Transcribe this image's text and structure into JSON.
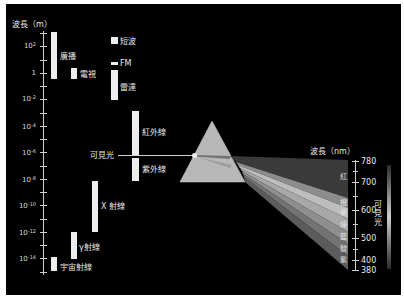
{
  "left_axis": {
    "title": "波長（m）",
    "ticks": [
      {
        "base": "10",
        "exp": "2",
        "y": 46
      },
      {
        "base": "1",
        "exp": "",
        "y": 73
      },
      {
        "base": "10",
        "exp": "-2",
        "y": 99
      },
      {
        "base": "10",
        "exp": "-4",
        "y": 127
      },
      {
        "base": "10",
        "exp": "-6",
        "y": 153
      },
      {
        "base": "10",
        "exp": "-8",
        "y": 180
      },
      {
        "base": "10",
        "exp": "-10",
        "y": 206
      },
      {
        "base": "10",
        "exp": "-12",
        "y": 233
      },
      {
        "base": "10",
        "exp": "-14",
        "y": 259
      }
    ]
  },
  "bands": [
    {
      "label": "廣播",
      "x": 51,
      "y": 32,
      "w": 6,
      "h": 47,
      "lx": 60,
      "ly": 52
    },
    {
      "label": "電視",
      "x": 71,
      "y": 68,
      "w": 6,
      "h": 11,
      "lx": 80,
      "ly": 70
    },
    {
      "label": "短波",
      "x": 111,
      "y": 37,
      "w": 7,
      "h": 7,
      "lx": 120,
      "ly": 37
    },
    {
      "label": "FM",
      "x": 111,
      "y": 62,
      "w": 7,
      "h": 3,
      "lx": 120,
      "ly": 59
    },
    {
      "label": "雷達",
      "x": 111,
      "y": 70,
      "w": 7,
      "h": 30,
      "lx": 120,
      "ly": 83
    },
    {
      "label": "紅外線",
      "x": 132,
      "y": 111,
      "w": 7,
      "h": 44,
      "lx": 142,
      "ly": 128
    },
    {
      "label": "紫外線",
      "x": 132,
      "y": 158,
      "w": 7,
      "h": 23,
      "lx": 142,
      "ly": 165
    },
    {
      "label": "X 射線",
      "x": 92,
      "y": 181,
      "w": 6,
      "h": 51,
      "lx": 101,
      "ly": 202
    },
    {
      "label": "γ射線",
      "x": 71,
      "y": 232,
      "w": 6,
      "h": 27,
      "lx": 79,
      "ly": 243
    },
    {
      "label": "宇宙射線",
      "x": 51,
      "y": 257,
      "w": 6,
      "h": 14,
      "lx": 60,
      "ly": 263
    }
  ],
  "visible_light_label": "可見光",
  "right_axis": {
    "title": "波長（nm）",
    "ticks": [
      {
        "label": "780",
        "y": 161
      },
      {
        "label": "700",
        "y": 182
      },
      {
        "label": "600",
        "y": 210
      },
      {
        "label": "500",
        "y": 238
      },
      {
        "label": "400",
        "y": 260
      },
      {
        "label": "380",
        "y": 270
      }
    ],
    "side_label": "可見光"
  },
  "spectrum_colors": [
    {
      "label": "紅",
      "y": 177,
      "fill": "#3a3a3a"
    },
    {
      "label": "橙",
      "y": 203,
      "fill": "#8c8c8c"
    },
    {
      "label": "黄",
      "y": 213,
      "fill": "#b8b8b8"
    },
    {
      "label": "綠",
      "y": 225,
      "fill": "#a6a6a6"
    },
    {
      "label": "藍",
      "y": 237,
      "fill": "#8a8a8a"
    },
    {
      "label": "靛",
      "y": 249,
      "fill": "#6e6e6e"
    },
    {
      "label": "紫",
      "y": 260,
      "fill": "#5a5a5a"
    }
  ]
}
